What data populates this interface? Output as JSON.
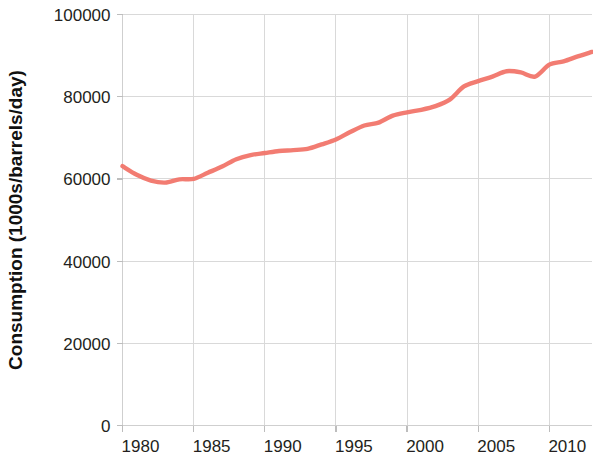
{
  "chart_data": {
    "type": "line",
    "title": "",
    "xlabel": "",
    "ylabel": "Consumption (1000s/barrels/day)",
    "xlim": [
      1980,
      2013
    ],
    "ylim": [
      0,
      100000
    ],
    "grid": true,
    "legend": "none",
    "line_color": "#F1756A",
    "x_ticks": [
      1980,
      1985,
      1990,
      1995,
      2000,
      2005,
      2010
    ],
    "x_tick_labels": [
      "1980",
      "1985",
      "1990",
      "1995",
      "2000",
      "2005",
      "2010"
    ],
    "y_ticks": [
      0,
      20000,
      40000,
      60000,
      80000,
      100000
    ],
    "y_tick_labels": [
      "0",
      "20000",
      "40000",
      "60000",
      "80000",
      "100000"
    ],
    "series": [
      {
        "name": "World oil consumption",
        "x": [
          1980,
          1981,
          1982,
          1983,
          1984,
          1985,
          1986,
          1987,
          1988,
          1989,
          1990,
          1991,
          1992,
          1993,
          1994,
          1995,
          1996,
          1997,
          1998,
          1999,
          2000,
          2001,
          2002,
          2003,
          2004,
          2005,
          2006,
          2007,
          2008,
          2009,
          2010,
          2011,
          2012,
          2013
        ],
        "values": [
          63100,
          61000,
          59600,
          59100,
          59900,
          60000,
          61500,
          63000,
          64800,
          65800,
          66300,
          66800,
          67000,
          67300,
          68400,
          69600,
          71400,
          73000,
          73700,
          75400,
          76200,
          76800,
          77700,
          79300,
          82500,
          83800,
          84900,
          86200,
          85900,
          84900,
          87800,
          88600,
          89800,
          90900
        ]
      }
    ]
  }
}
